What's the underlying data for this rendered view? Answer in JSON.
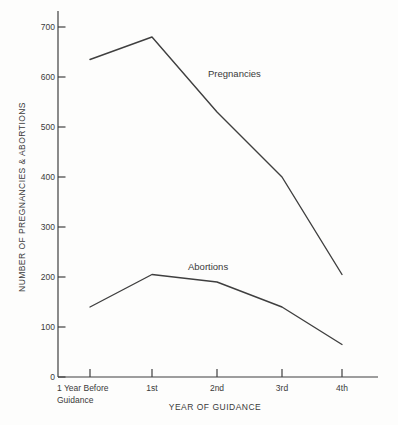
{
  "figure": {
    "background_color": "#fdfdfc",
    "line_color": "#3f3f3f",
    "text_color": "#3a3a3a"
  },
  "chart_data": {
    "type": "line",
    "title": "",
    "categories": [
      "1 Year Before Guidance",
      "1st",
      "2nd",
      "3rd",
      "4th"
    ],
    "xtick_lines": [
      [
        "1 Year Before",
        "Guidance"
      ],
      [
        "1st"
      ],
      [
        "2nd"
      ],
      [
        "3rd"
      ],
      [
        "4th"
      ]
    ],
    "series": [
      {
        "name": "Pregnancies",
        "values": [
          635,
          680,
          530,
          400,
          205
        ]
      },
      {
        "name": "Abortions",
        "values": [
          140,
          205,
          190,
          140,
          65
        ]
      }
    ],
    "xlabel": "YEAR OF GUIDANCE",
    "ylabel": "NUMBER OF PREGNANCIES & ABORTIONS",
    "ylim": [
      0,
      750
    ],
    "yticks": [
      0,
      100,
      200,
      300,
      400,
      500,
      600,
      700
    ],
    "grid": false,
    "legend": "inline-annotations"
  }
}
